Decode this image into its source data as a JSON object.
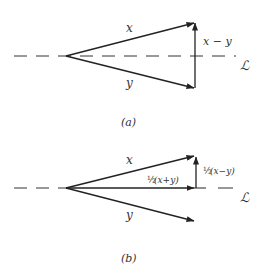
{
  "figure_a": {
    "caption": "(a)",
    "labels": {
      "x": "x",
      "y": "y",
      "diff": "x − y",
      "line": "ℒ"
    },
    "origin": [
      66,
      56
    ],
    "x_tip": [
      195,
      23
    ],
    "y_tip": [
      195,
      88
    ]
  },
  "figure_b": {
    "caption": "(b)",
    "labels": {
      "x": "x",
      "y": "y",
      "half_sum_frac": "½",
      "half_sum": "(x+y)",
      "half_diff_frac": "½",
      "half_diff": "(x−y)",
      "line": "ℒ"
    },
    "origin": [
      66,
      188
    ],
    "x_tip": [
      195,
      156
    ],
    "y_tip": [
      195,
      221
    ],
    "sum_tip": [
      195,
      188
    ]
  },
  "colors": {
    "stroke": "#222222",
    "text": "#333333",
    "background": "#ffffff"
  }
}
